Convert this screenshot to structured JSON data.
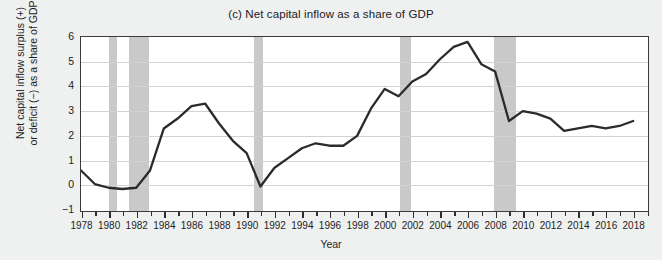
{
  "chart_data": {
    "type": "line",
    "title": "(c) Net capital inflow as a share of GDP",
    "xlabel": "Year",
    "ylabel": "Net capital inflow surplus (+)\nor deficit (−) as a share of GDP",
    "ylabel_line1": "Net capital inflow surplus (+)",
    "ylabel_line2": "or deficit (−) as a share of GDP",
    "xlim": [
      1978,
      2019
    ],
    "ylim": [
      -1,
      6
    ],
    "yticks": [
      6,
      5,
      4,
      3,
      2,
      1,
      0,
      -1
    ],
    "ytick_labels": [
      "6",
      "5",
      "4",
      "3",
      "2",
      "1",
      "0",
      "−1"
    ],
    "xticks": [
      1978,
      1980,
      1982,
      1984,
      1986,
      1988,
      1990,
      1992,
      1994,
      1996,
      1998,
      2000,
      2002,
      2004,
      2006,
      2008,
      2010,
      2012,
      2014,
      2016,
      2018
    ],
    "xtick_labels": [
      "1978",
      "1980",
      "1982",
      "1984",
      "1986",
      "1988",
      "1990",
      "1992",
      "1994",
      "1996",
      "1998",
      "2000",
      "2002",
      "2004",
      "2006",
      "2008",
      "2010",
      "2012",
      "2014",
      "2016",
      "2018"
    ],
    "minor_xticks_every": 1,
    "grid": "horizontal",
    "legend": "none",
    "line_color": "#2b2b2b",
    "band_color": "#c9c9c9",
    "plot_bg": "#ffffff",
    "page_bg": "#eff0f0",
    "axis_color": "#3b3b3b",
    "gridline_color": "#d2d2d2",
    "shaded_regions": [
      {
        "label": "recession",
        "start": 1980.0,
        "end": 1980.6
      },
      {
        "label": "recession",
        "start": 1981.5,
        "end": 1982.9
      },
      {
        "label": "recession",
        "start": 1990.5,
        "end": 1991.2
      },
      {
        "label": "recession",
        "start": 2001.1,
        "end": 2001.9
      },
      {
        "label": "recession",
        "start": 2007.9,
        "end": 2009.5
      }
    ],
    "x": [
      1978,
      1979,
      1980,
      1981,
      1982,
      1983,
      1984,
      1985,
      1986,
      1987,
      1988,
      1989,
      1990,
      1991,
      1992,
      1993,
      1994,
      1995,
      1996,
      1997,
      1998,
      1999,
      2000,
      2001,
      2002,
      2003,
      2004,
      2005,
      2006,
      2007,
      2008,
      2009,
      2010,
      2011,
      2012,
      2013,
      2014,
      2015,
      2016,
      2017,
      2018
    ],
    "values": [
      0.6,
      0.05,
      -0.1,
      -0.15,
      -0.1,
      0.6,
      2.3,
      2.7,
      3.2,
      3.3,
      2.5,
      1.8,
      1.3,
      -0.05,
      0.7,
      1.1,
      1.5,
      1.7,
      1.6,
      1.6,
      2.0,
      3.1,
      3.9,
      3.6,
      4.2,
      4.5,
      5.1,
      5.6,
      5.8,
      4.9,
      4.6,
      2.6,
      3.0,
      2.9,
      2.7,
      2.2,
      2.3,
      2.4,
      2.3,
      2.4,
      2.6
    ],
    "series_name": "Net capital inflow as a share of GDP"
  }
}
